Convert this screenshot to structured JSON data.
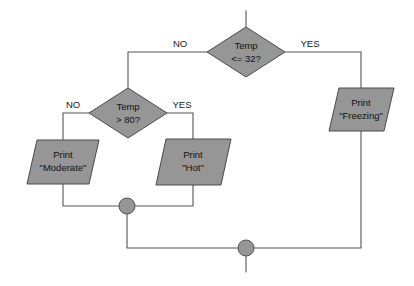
{
  "diagram": {
    "type": "flowchart",
    "colors": {
      "shape_fill": "#969696",
      "shape_stroke": "#4a4a4a",
      "line": "#555555",
      "background": "#ffffff",
      "text": "#111111"
    },
    "decisions": [
      {
        "id": "temp-le-32",
        "line1": "Temp",
        "line2": "<= 32?",
        "no_label": "NO",
        "yes_label": "YES"
      },
      {
        "id": "temp-gt-80",
        "line1": "Temp",
        "line2": "> 80?",
        "no_label": "NO",
        "yes_label": "YES"
      }
    ],
    "outputs": [
      {
        "id": "print-freezing",
        "line1": "Print",
        "line2": "\"Freezing\""
      },
      {
        "id": "print-moderate",
        "line1": "Print",
        "line2": "\"Moderate\""
      },
      {
        "id": "print-hot",
        "line1": "Print",
        "line2": "\"Hot\""
      }
    ],
    "connectors": [
      {
        "id": "merge-upper"
      },
      {
        "id": "merge-lower"
      }
    ]
  }
}
